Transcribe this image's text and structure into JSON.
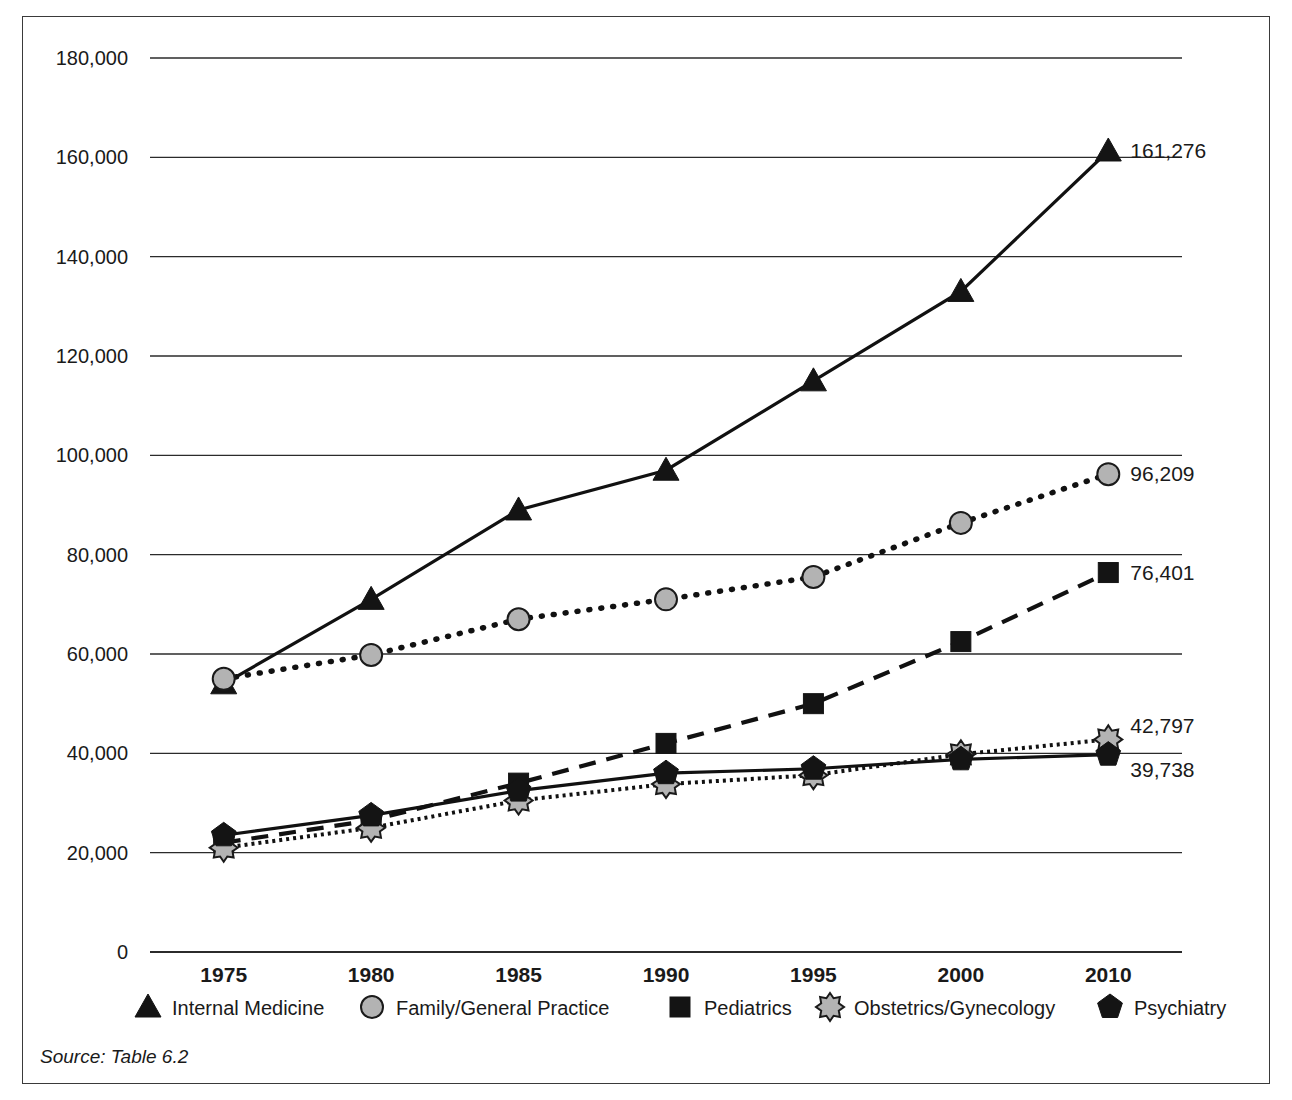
{
  "figure": {
    "source_note": "Source: Table 6.2"
  },
  "chart_data": {
    "type": "line",
    "title": "",
    "xlabel": "",
    "ylabel": "",
    "grid": true,
    "legend_position": "bottom",
    "categories": [
      "1975",
      "1980",
      "1985",
      "1990",
      "1995",
      "2000",
      "2010"
    ],
    "ylim": [
      0,
      180000
    ],
    "yticks": [
      "0",
      "20,000",
      "40,000",
      "60,000",
      "80,000",
      "100,000",
      "120,000",
      "140,000",
      "160,000",
      "180,000"
    ],
    "ytick_values": [
      0,
      20000,
      40000,
      60000,
      80000,
      100000,
      120000,
      140000,
      160000,
      180000
    ],
    "series": [
      {
        "name": "Internal Medicine",
        "marker": "triangle",
        "line_style": "solid",
        "color": "#141414",
        "values": [
          54000,
          71000,
          89000,
          97000,
          115000,
          133000,
          161276
        ],
        "end_label": "161,276"
      },
      {
        "name": "Family/General Practice",
        "marker": "circle",
        "line_style": "dotted",
        "color": "#141414",
        "marker_fill": "#b3b3b3",
        "values": [
          55000,
          59800,
          67000,
          71000,
          75500,
          86400,
          96209
        ],
        "end_label": "96,209"
      },
      {
        "name": "Pediatrics",
        "marker": "square",
        "line_style": "dashed",
        "color": "#141414",
        "values": [
          22000,
          26500,
          34000,
          42000,
          50000,
          62500,
          76401
        ],
        "end_label": "76,401"
      },
      {
        "name": "Obstetrics/Gynecology",
        "marker": "star",
        "line_style": "beaded",
        "color": "#141414",
        "marker_fill": "#b3b3b3",
        "values": [
          21000,
          25000,
          30500,
          33800,
          35600,
          39800,
          42797
        ],
        "end_label": "42,797"
      },
      {
        "name": "Psychiatry",
        "marker": "pentagon",
        "line_style": "solid",
        "color": "#141414",
        "values": [
          23500,
          27500,
          32500,
          36000,
          36900,
          38800,
          39738
        ],
        "end_label": "39,738"
      }
    ]
  },
  "legend": {
    "items": [
      {
        "label": "Internal Medicine",
        "marker": "triangle"
      },
      {
        "label": "Family/General Practice",
        "marker": "circle"
      },
      {
        "label": "Pediatrics",
        "marker": "square"
      },
      {
        "label": "Obstetrics/Gynecology",
        "marker": "star"
      },
      {
        "label": "Psychiatry",
        "marker": "pentagon"
      }
    ]
  },
  "colors": {
    "ink": "#1a1a1a",
    "grid": "#2b2b2b",
    "marker_grey": "#b3b3b3",
    "frame": "#3a3a3a"
  }
}
